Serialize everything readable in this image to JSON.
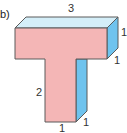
{
  "figure": {
    "part_label": "b)",
    "shape": "T-shaped prism",
    "colors": {
      "front_face": "#f4b6b6",
      "top_face": "#d4eef8",
      "side_face": "#6fc3ee",
      "edge": "#5a5a5a"
    },
    "dimensions": {
      "top_length": "3",
      "top_depth": "1",
      "top_bar_height": "1",
      "stem_height": "2",
      "stem_width": "1",
      "stem_depth": "1"
    }
  }
}
